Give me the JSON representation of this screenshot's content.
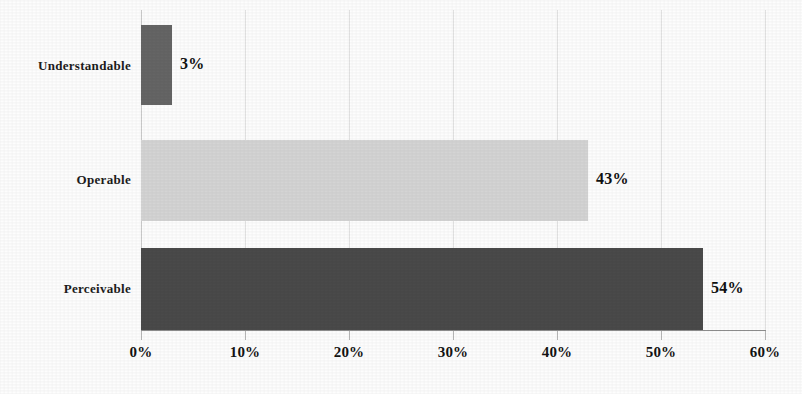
{
  "chart_data": {
    "type": "bar",
    "orientation": "horizontal",
    "title": "",
    "xlabel": "",
    "ylabel": "",
    "categories": [
      "Understandable",
      "Operable",
      "Perceivable"
    ],
    "values": [
      3,
      43,
      54
    ],
    "value_labels": [
      "3%",
      "43%",
      "54%"
    ],
    "series": [
      {
        "name": "",
        "values": [
          3,
          43,
          54
        ]
      }
    ],
    "bar_colors": [
      "#656565",
      "#d4d4d4",
      "#4a4a4a"
    ],
    "xlim": [
      0,
      60
    ],
    "xticks": [
      0,
      10,
      20,
      30,
      40,
      50,
      60
    ],
    "xtick_labels": [
      "0%",
      "10%",
      "20%",
      "30%",
      "40%",
      "50%",
      "60%"
    ],
    "grid": true,
    "grid_axis": "x",
    "legend": false,
    "legend_position": "none",
    "background_color": "#ffffff",
    "axis_line_color": "#8f8f8f",
    "gridline_color": "#e2e2e2",
    "text_color": "#111111"
  },
  "bars": [
    {
      "category": "Understandable",
      "value": 3,
      "label": "3%",
      "color": "#656565"
    },
    {
      "category": "Operable",
      "value": 43,
      "label": "43%",
      "color": "#d4d4d4"
    },
    {
      "category": "Perceivable",
      "value": 54,
      "label": "54%",
      "color": "#4a4a4a"
    }
  ],
  "xaxis": {
    "ticks": [
      "0%",
      "10%",
      "20%",
      "30%",
      "40%",
      "50%",
      "60%"
    ]
  }
}
